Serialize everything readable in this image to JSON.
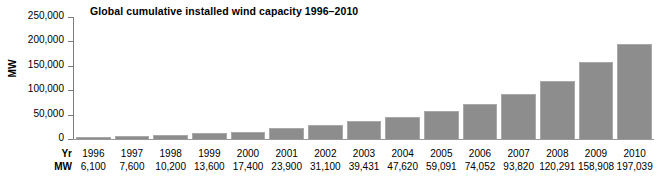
{
  "chart_data": {
    "type": "bar",
    "title": "Global cumulative installed wind capacity 1996–2010",
    "xlabel": "",
    "ylabel": "MW",
    "ylim": [
      0,
      250000
    ],
    "grid": false,
    "legend": "none",
    "y_ticks": [
      "0",
      "50,000",
      "100,000",
      "150,000",
      "200,000",
      "250,000"
    ],
    "y_tick_values": [
      0,
      50000,
      100000,
      150000,
      200000,
      250000
    ],
    "categories": [
      "1996",
      "1997",
      "1998",
      "1999",
      "2000",
      "2001",
      "2002",
      "2003",
      "2004",
      "2005",
      "2006",
      "2007",
      "2008",
      "2009",
      "2010"
    ],
    "values": [
      6100,
      7600,
      10200,
      13600,
      17400,
      23900,
      31100,
      39431,
      47620,
      59091,
      74052,
      93820,
      120291,
      158908,
      197039
    ],
    "value_labels": [
      "6,100",
      "7,600",
      "10,200",
      "13,600",
      "17,400",
      "23,900",
      "31,100",
      "39,431",
      "47,620",
      "59,091",
      "74,052",
      "93,820",
      "120,291",
      "158,908",
      "197,039"
    ],
    "bar_color": "#8d8d8d",
    "bar_border_color": "#a9a9a9",
    "axis_color": "#7d7d7d",
    "background_color": "#ffffff"
  },
  "data_table": {
    "row_headers": [
      "Yr",
      "MW"
    ],
    "years": [
      "1996",
      "1997",
      "1998",
      "1999",
      "2000",
      "2001",
      "2002",
      "2003",
      "2004",
      "2005",
      "2006",
      "2007",
      "2008",
      "2009",
      "2010"
    ],
    "mw": [
      "6,100",
      "7,600",
      "10,200",
      "13,600",
      "17,400",
      "23,900",
      "31,100",
      "39,431",
      "47,620",
      "59,091",
      "74,052",
      "93,820",
      "120,291",
      "158,908",
      "197,039"
    ]
  }
}
